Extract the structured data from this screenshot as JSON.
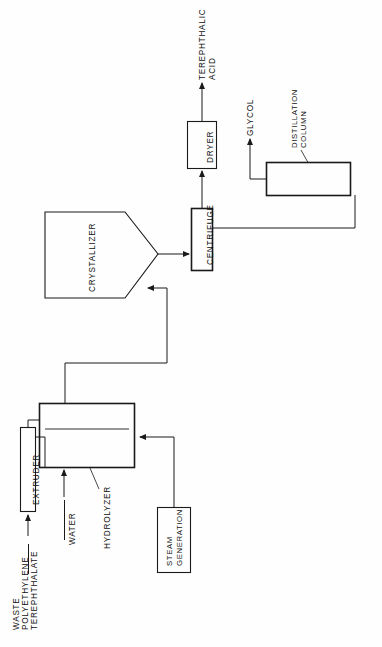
{
  "diagram": {
    "orientation": "rotated-90-ccw",
    "line_color": "#1a1a1a",
    "background": "#ffffff",
    "nodes": [
      {
        "id": "extruder",
        "label": "EXTRUDER",
        "shape": "rect"
      },
      {
        "id": "hydrolyzer",
        "label": "HYDROLYZER",
        "shape": "rect-with-divider"
      },
      {
        "id": "steam-generation",
        "label": "STEAM\nGENERATION",
        "shape": "rect"
      },
      {
        "id": "crystallizer",
        "label": "CRYSTALLIZER",
        "shape": "pentagon"
      },
      {
        "id": "centrifuge",
        "label": "CENTRIFUGE",
        "shape": "rect"
      },
      {
        "id": "dryer",
        "label": "DRYER",
        "shape": "rect"
      },
      {
        "id": "distillation-column",
        "label": "DISTILLATION\nCOLUMN",
        "shape": "rect"
      }
    ],
    "stream_labels": [
      {
        "id": "feed",
        "label": "WASTE\nPOLYETHYLENE\nTEREPHTHALATE"
      },
      {
        "id": "water",
        "label": "WATER"
      },
      {
        "id": "acid",
        "label": "TEREPHTHALIC\nACID"
      },
      {
        "id": "glycol",
        "label": "GLYCOL"
      }
    ],
    "labels": {
      "waste_pet_line1": "WASTE",
      "waste_pet_line2": "POLYETHYLENE",
      "waste_pet_line3": "TEREPHTHALATE",
      "water": "WATER",
      "extruder": "EXTRUDER",
      "hydrolyzer": "HYDROLYZER",
      "steam_line1": "STEAM",
      "steam_line2": "GENERATION",
      "crystallizer": "CRYSTALLIZER",
      "centrifuge": "CENTRIFUGE",
      "dryer": "DRYER",
      "terephthalic_line1": "TEREPHTHALIC",
      "terephthalic_line2": "ACID",
      "glycol": "GLYCOL",
      "distillation_line1": "DISTILLATION",
      "distillation_line2": "COLUMN"
    },
    "connections": [
      {
        "from": "feed",
        "to": "extruder"
      },
      {
        "from": "extruder",
        "to": "hydrolyzer"
      },
      {
        "from": "water",
        "to": "hydrolyzer"
      },
      {
        "from": "steam-generation",
        "to": "hydrolyzer"
      },
      {
        "from": "hydrolyzer",
        "to": "crystallizer"
      },
      {
        "from": "crystallizer",
        "to": "centrifuge"
      },
      {
        "from": "centrifuge",
        "to": "dryer"
      },
      {
        "from": "dryer",
        "to": "acid"
      },
      {
        "from": "centrifuge",
        "to": "distillation-column"
      },
      {
        "from": "distillation-column",
        "to": "glycol"
      }
    ]
  }
}
